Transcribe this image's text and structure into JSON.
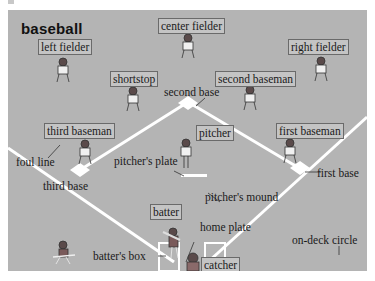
{
  "title": "baseball",
  "colors": {
    "field": "#b4b4b4",
    "lines": "#ffffff",
    "tag_bg": "#c4c4c4",
    "tag_border": "#6a6a6a",
    "text": "#1a1a1a"
  },
  "player_tags": [
    {
      "id": "center-fielder",
      "label": "center fielder"
    },
    {
      "id": "left-fielder",
      "label": "left fielder"
    },
    {
      "id": "right-fielder",
      "label": "right fielder"
    },
    {
      "id": "shortstop",
      "label": "shortstop"
    },
    {
      "id": "second-baseman",
      "label": "second baseman"
    },
    {
      "id": "third-baseman",
      "label": "third baseman"
    },
    {
      "id": "pitcher",
      "label": "pitcher"
    },
    {
      "id": "first-baseman",
      "label": "first baseman"
    },
    {
      "id": "batter",
      "label": "batter"
    },
    {
      "id": "catcher",
      "label": "catcher"
    }
  ],
  "field_labels": [
    {
      "id": "second-base",
      "label": "second base"
    },
    {
      "id": "foul-line",
      "label": "foul line"
    },
    {
      "id": "pitchers-plate",
      "label": "pitcher's plate"
    },
    {
      "id": "first-base",
      "label": "first base"
    },
    {
      "id": "third-base",
      "label": "third base"
    },
    {
      "id": "pitchers-mound",
      "label": "pitcher's mound"
    },
    {
      "id": "home-plate",
      "label": "home plate"
    },
    {
      "id": "on-deck-circle",
      "label": "on-deck circle"
    },
    {
      "id": "batters-box",
      "label": "batter's box"
    }
  ]
}
